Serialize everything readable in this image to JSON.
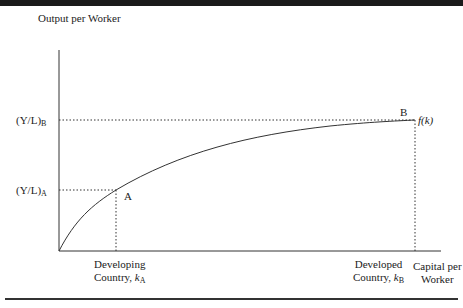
{
  "figure": {
    "y_axis_label": "Output per Worker",
    "x_axis_label_line1": "Capital per",
    "x_axis_label_line2": "Worker",
    "curve_label": "f(k)",
    "y_tick_B_main": "(Y/L)",
    "y_tick_B_sub": "B",
    "y_tick_A_main": "(Y/L)",
    "y_tick_A_sub": "A",
    "point_A": "A",
    "point_B": "B",
    "x_tick_A_line1": "Developing",
    "x_tick_A_line2": "Country, ",
    "x_tick_A_var": "k",
    "x_tick_A_sub": "A",
    "x_tick_B_line1": "Developed",
    "x_tick_B_line2": "Country, ",
    "x_tick_B_var": "k",
    "x_tick_B_sub": "B"
  },
  "colors": {
    "axis": "#333333",
    "curve": "#333333",
    "guide": "#333333",
    "top_bar": "#1a1a1a"
  }
}
